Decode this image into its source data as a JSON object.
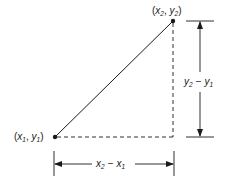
{
  "diagram": {
    "point1": {
      "label_x": "x",
      "label_x_sub": "1",
      "label_y": "y",
      "label_y_sub": "1",
      "text": "(x1, y1)"
    },
    "point2": {
      "label_x": "x",
      "label_x_sub": "2",
      "label_y": "y",
      "label_y_sub": "2",
      "text": "(x2, y2)"
    },
    "horizontal_dimension": {
      "text": "x2 − x1",
      "a": "x",
      "a_sub": "2",
      "op": "−",
      "b": "x",
      "b_sub": "1"
    },
    "vertical_dimension": {
      "text": "y2 − y1",
      "a": "y",
      "a_sub": "2",
      "op": "−",
      "b": "y",
      "b_sub": "1"
    },
    "colors": {
      "stroke": "#1a1a1a",
      "background": "#ffffff"
    }
  }
}
